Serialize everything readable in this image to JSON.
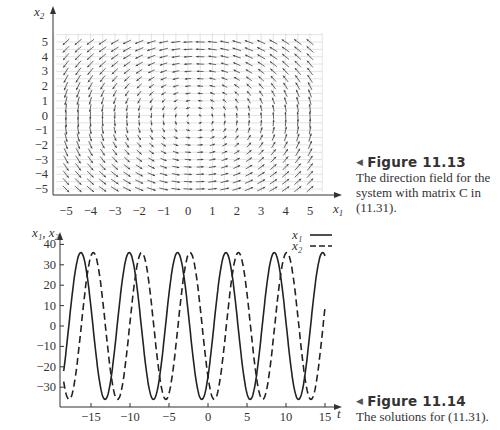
{
  "figures": [
    {
      "number_label": "Figure 11.13",
      "caption": "The direction field for the system with matrix C in (11.31).",
      "caption_lines": [
        "The direction field for the",
        "system with matrix C in",
        "(11.31)."
      ]
    },
    {
      "number_label": "Figure 11.14",
      "caption": "The solutions for (11.31).",
      "caption_lines": [
        "The solutions for (11.31)."
      ]
    }
  ],
  "chart_data": [
    {
      "type": "quiver",
      "title": "",
      "xlabel": "x1",
      "ylabel": "x2",
      "xlim": [
        -5,
        5
      ],
      "ylim": [
        -5,
        5
      ],
      "xticks": [
        -5,
        -4,
        -3,
        -2,
        -1,
        0,
        1,
        2,
        3,
        4,
        5
      ],
      "yticks": [
        5,
        4,
        3,
        2,
        1,
        0,
        -1,
        -2,
        -3,
        -4,
        -5
      ],
      "grid": true,
      "grid_step": 0.5,
      "description": "Direction field with counterclockwise rotation about the origin; arrows point left along the top, down along the left, right along the bottom and up along the right."
    },
    {
      "type": "line",
      "title": "",
      "xlabel": "t",
      "ylabel": "x1, x2",
      "xlim": [
        -18.5,
        15
      ],
      "ylim": [
        -38,
        43
      ],
      "xticks": [
        -15,
        -10,
        -5,
        0,
        5,
        10,
        15
      ],
      "yticks": [
        40,
        30,
        20,
        10,
        0,
        -10,
        -20,
        -30
      ],
      "grid": false,
      "legend": {
        "position": "upper right",
        "entries": [
          "x1",
          "x2"
        ]
      },
      "series": [
        {
          "name": "x1",
          "style": "solid",
          "amplitude": 36,
          "period": 6.2,
          "peaks_t": [
            -16.3,
            -10.1,
            -3.9,
            2.8,
            8.9
          ],
          "troughs_t": [
            -13.2,
            -7.0,
            -0.7,
            5.9,
            12.1
          ]
        },
        {
          "name": "x2",
          "style": "dashed",
          "amplitude": 36,
          "period": 6.2,
          "peaks_t": [
            -14.7,
            -8.5,
            -2.2,
            4.3,
            10.4
          ],
          "troughs_t": [
            -17.8,
            -11.6,
            -5.4,
            0.9,
            7.4,
            13.6
          ]
        }
      ]
    }
  ],
  "labels": {
    "top": {
      "ylabel_main": "x",
      "ylabel_sub": "2",
      "xlabel_main": "x",
      "xlabel_sub": "1",
      "xticks": [
        "−5",
        "−4",
        "−3",
        "−2",
        "−1",
        "0",
        "1",
        "2",
        "3",
        "4",
        "5"
      ],
      "yticks": [
        "5",
        "4",
        "3",
        "2",
        "1",
        "0",
        "−1",
        "−2",
        "−3",
        "−4",
        "−5"
      ]
    },
    "bottom": {
      "ylabel": "x₁, x₂",
      "xlabel": "t",
      "xticks": [
        "−15",
        "−10",
        "−5",
        "0",
        "5",
        "10",
        "15"
      ],
      "yticks": [
        "40",
        "30",
        "20",
        "10",
        "0",
        "−10",
        "−20",
        "−30"
      ],
      "legend_x1": "x₁",
      "legend_x2": "x₂"
    }
  }
}
